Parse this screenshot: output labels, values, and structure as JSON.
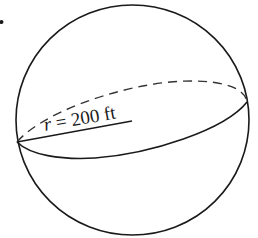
{
  "figure": {
    "type": "sphere",
    "radius_label": {
      "variable": "r",
      "equals": " = ",
      "value": "200 ft"
    },
    "radius_value": 200,
    "radius_unit": "ft",
    "colors": {
      "stroke": "#1a1a1a",
      "background": "#ffffff"
    }
  }
}
